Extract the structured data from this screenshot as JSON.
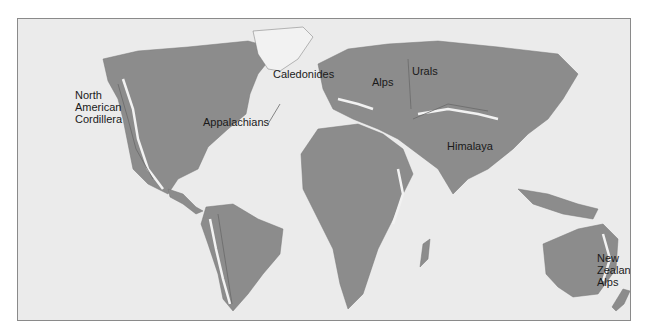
{
  "figure": {
    "type": "world map of major mountain belts",
    "colors": {
      "ocean": "#ebebeb",
      "land": "#8c8c8c",
      "mountain_belt": "#f2f2f2",
      "ridge_lines": "#6a6a6a",
      "frame": "#8a8a8a"
    }
  },
  "labels": {
    "cordillera": "North\nAmerican\nCordillera",
    "appalachians": "Appalachians",
    "caledonides": "Caledonides",
    "alps": "Alps",
    "urals": "Urals",
    "himalaya": "Himalaya",
    "nz_alps": "New\nZealand\nAlps"
  }
}
